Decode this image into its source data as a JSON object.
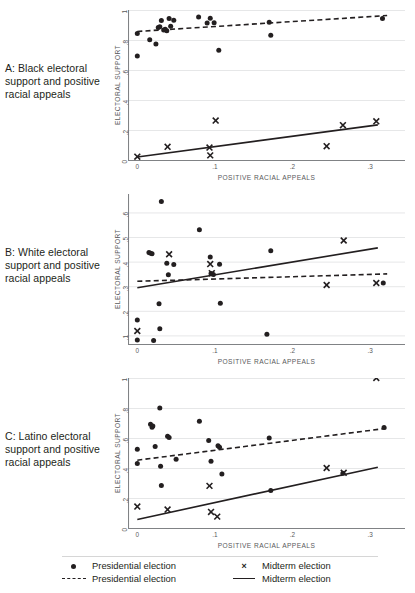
{
  "figure": {
    "title_remnant": "",
    "panels": [
      {
        "id": "A",
        "caption": "A: Black electoral support and positive racial appeals",
        "xlabel": "POSITIVE RACIAL APPEALS",
        "ylabel": "ELECTORAL SUPPORT"
      },
      {
        "id": "B",
        "caption": "B: White electoral support and positive racial appeals",
        "xlabel": "POSITIVE RACIAL APPEALS",
        "ylabel": "ELECTORAL SUPPORT"
      },
      {
        "id": "C",
        "caption": "C: Latino electoral support and positive racial appeals",
        "xlabel": "POSITIVE RACIAL APPEALS",
        "ylabel": "ELECTORAL SUPPORT"
      }
    ]
  },
  "legend": {
    "entries": [
      {
        "marker": "dot",
        "label": "Presidential election"
      },
      {
        "marker": "x",
        "label": "Midterm election"
      },
      {
        "marker": "dash",
        "label": "Presidential election"
      },
      {
        "marker": "line",
        "label": "Midterm election"
      }
    ],
    "marker_glyph_x": "×"
  },
  "colors": {
    "ink": "#231f20",
    "axis": "#808285",
    "grid": "#e6e7e8",
    "tick_text": "#58595b"
  },
  "chart_data": [
    {
      "type": "scatter",
      "panel": "A",
      "title": "A: Black electoral support and positive racial appeals",
      "xlabel": "POSITIVE RACIAL APPEALS",
      "ylabel": "ELECTORAL SUPPORT",
      "xlim": [
        -0.012,
        0.345
      ],
      "ylim": [
        0.0,
        1.0
      ],
      "xticks": [
        0,
        0.1,
        0.2,
        0.3
      ],
      "xticklabels": [
        "0",
        ".1",
        ".2",
        ".3"
      ],
      "yticks": [
        0,
        0.2,
        0.4,
        0.6,
        0.8,
        1.0
      ],
      "yticklabels": [
        "0",
        ".2",
        ".4",
        ".6",
        ".8",
        "1"
      ],
      "grid": "horizontal",
      "legend_position": "figure-bottom",
      "series": [
        {
          "name": "Presidential election",
          "marker": "dot",
          "points": [
            [
              0.0,
              0.843
            ],
            [
              0.0,
              0.693
            ],
            [
              0.016,
              0.801
            ],
            [
              0.024,
              0.774
            ],
            [
              0.027,
              0.884
            ],
            [
              0.029,
              0.888
            ],
            [
              0.031,
              0.93
            ],
            [
              0.034,
              0.866
            ],
            [
              0.036,
              0.872
            ],
            [
              0.038,
              0.862
            ],
            [
              0.041,
              0.944
            ],
            [
              0.043,
              0.892
            ],
            [
              0.047,
              0.932
            ],
            [
              0.079,
              0.953
            ],
            [
              0.09,
              0.913
            ],
            [
              0.094,
              0.945
            ],
            [
              0.099,
              0.915
            ],
            [
              0.105,
              0.731
            ],
            [
              0.17,
              0.918
            ],
            [
              0.172,
              0.832
            ],
            [
              0.316,
              0.944
            ]
          ]
        },
        {
          "name": "Midterm election",
          "marker": "x",
          "points": [
            [
              0.0,
              0.022
            ],
            [
              0.039,
              0.088
            ],
            [
              0.093,
              0.083
            ],
            [
              0.094,
              0.031
            ],
            [
              0.101,
              0.263
            ],
            [
              0.244,
              0.092
            ],
            [
              0.265,
              0.232
            ],
            [
              0.308,
              0.258
            ]
          ]
        },
        {
          "name": "Presidential election",
          "marker": "dash",
          "fit_line": {
            "x0": 0.0,
            "y0": 0.857,
            "x1": 0.322,
            "y1": 0.963
          }
        },
        {
          "name": "Midterm election",
          "marker": "line",
          "fit_line": {
            "x0": 0.0,
            "y0": 0.02,
            "x1": 0.31,
            "y1": 0.234
          }
        }
      ]
    },
    {
      "type": "scatter",
      "panel": "B",
      "title": "B: White electoral support and positive racial appeals",
      "xlabel": "POSITIVE RACIAL APPEALS",
      "ylabel": "ELECTORAL SUPPORT",
      "xlim": [
        -0.012,
        0.345
      ],
      "ylim": [
        0.065,
        0.675
      ],
      "xticks": [
        0,
        0.1,
        0.2,
        0.3
      ],
      "xticklabels": [
        "0",
        ".1",
        ".2",
        ".3"
      ],
      "yticks": [
        0.1,
        0.2,
        0.3,
        0.4,
        0.5,
        0.6
      ],
      "yticklabels": [
        ".1",
        ".2",
        ".3",
        ".4",
        ".5",
        ".6"
      ],
      "grid": "horizontal",
      "legend_position": "figure-bottom",
      "series": [
        {
          "name": "Presidential election",
          "marker": "dot",
          "points": [
            [
              0.0,
              0.163
            ],
            [
              0.0,
              0.081
            ],
            [
              0.015,
              0.437
            ],
            [
              0.017,
              0.434
            ],
            [
              0.019,
              0.432
            ],
            [
              0.021,
              0.079
            ],
            [
              0.028,
              0.229
            ],
            [
              0.029,
              0.127
            ],
            [
              0.031,
              0.645
            ],
            [
              0.038,
              0.393
            ],
            [
              0.04,
              0.347
            ],
            [
              0.047,
              0.388
            ],
            [
              0.08,
              0.53
            ],
            [
              0.094,
              0.419
            ],
            [
              0.095,
              0.352
            ],
            [
              0.098,
              0.348
            ],
            [
              0.106,
              0.389
            ],
            [
              0.107,
              0.231
            ],
            [
              0.167,
              0.105
            ],
            [
              0.172,
              0.444
            ],
            [
              0.317,
              0.313
            ]
          ]
        },
        {
          "name": "Midterm election",
          "marker": "x",
          "points": [
            [
              0.0,
              0.118
            ],
            [
              0.041,
              0.43
            ],
            [
              0.094,
              0.39
            ],
            [
              0.096,
              0.353
            ],
            [
              0.244,
              0.305
            ],
            [
              0.266,
              0.486
            ],
            [
              0.308,
              0.313
            ]
          ]
        },
        {
          "name": "Presidential election",
          "marker": "dash",
          "fit_line": {
            "x0": 0.0,
            "y0": 0.32,
            "x1": 0.322,
            "y1": 0.35
          }
        },
        {
          "name": "Midterm election",
          "marker": "line",
          "fit_line": {
            "x0": 0.0,
            "y0": 0.294,
            "x1": 0.31,
            "y1": 0.456
          }
        }
      ]
    },
    {
      "type": "scatter",
      "panel": "C",
      "title": "C: Latino electoral support and positive racial appeals",
      "xlabel": "POSITIVE RACIAL APPEALS",
      "ylabel": "ELECTORAL SUPPORT",
      "xlim": [
        -0.012,
        0.345
      ],
      "ylim": [
        0.0,
        1.0
      ],
      "xticks": [
        0,
        0.1,
        0.2,
        0.3
      ],
      "xticklabels": [
        "0",
        ".1",
        ".2",
        ".3"
      ],
      "yticks": [
        0,
        0.2,
        0.4,
        0.6,
        0.8,
        1.0
      ],
      "yticklabels": [
        "0",
        ".2",
        ".4",
        ".6",
        ".8",
        "1"
      ],
      "grid": "horizontal",
      "legend_position": "figure-bottom",
      "series": [
        {
          "name": "Presidential election",
          "marker": "dot",
          "points": [
            [
              0.0,
              0.525
            ],
            [
              0.0,
              0.43
            ],
            [
              0.017,
              0.692
            ],
            [
              0.019,
              0.672
            ],
            [
              0.02,
              0.68
            ],
            [
              0.023,
              0.543
            ],
            [
              0.029,
              0.8
            ],
            [
              0.03,
              0.412
            ],
            [
              0.031,
              0.283
            ],
            [
              0.039,
              0.612
            ],
            [
              0.041,
              0.604
            ],
            [
              0.05,
              0.458
            ],
            [
              0.08,
              0.712
            ],
            [
              0.092,
              0.583
            ],
            [
              0.095,
              0.445
            ],
            [
              0.104,
              0.548
            ],
            [
              0.106,
              0.538
            ],
            [
              0.109,
              0.36
            ],
            [
              0.17,
              0.6
            ],
            [
              0.172,
              0.25
            ],
            [
              0.265,
              0.365
            ],
            [
              0.318,
              0.67
            ]
          ]
        },
        {
          "name": "Midterm election",
          "marker": "x",
          "points": [
            [
              0.0,
              0.143
            ],
            [
              0.039,
              0.123
            ],
            [
              0.093,
              0.281
            ],
            [
              0.095,
              0.107
            ],
            [
              0.103,
              0.076
            ],
            [
              0.244,
              0.4
            ],
            [
              0.266,
              0.368
            ],
            [
              0.308,
              1.0
            ]
          ]
        },
        {
          "name": "Presidential election",
          "marker": "dash",
          "fit_line": {
            "x0": 0.0,
            "y0": 0.452,
            "x1": 0.322,
            "y1": 0.665
          }
        },
        {
          "name": "Midterm election",
          "marker": "line",
          "fit_line": {
            "x0": 0.0,
            "y0": 0.057,
            "x1": 0.31,
            "y1": 0.405
          }
        }
      ]
    }
  ]
}
